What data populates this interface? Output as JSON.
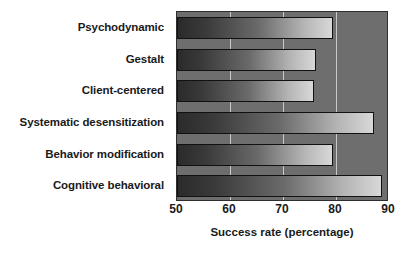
{
  "chart_data": {
    "type": "bar",
    "orientation": "horizontal",
    "title": "",
    "xlabel": "Success rate (percentage)",
    "ylabel": "",
    "categories": [
      "Psychodynamic",
      "Gestalt",
      "Client-centered",
      "Systematic desensitization",
      "Behavior modification",
      "Cognitive behavioral"
    ],
    "values": [
      79.5,
      76.3,
      75.8,
      87.2,
      79.5,
      88.6
    ],
    "xlim": [
      50,
      90
    ],
    "xticks": [
      50,
      60,
      70,
      80,
      90
    ],
    "xtick_labels": [
      "50",
      "60",
      "70",
      "80",
      "90"
    ],
    "grid": true,
    "grid_axis": "x",
    "legend": null,
    "plot_background": "#6e6e6e",
    "gridline_color": "#c9c9c9",
    "bar_gradient_from": "#2b2b2b",
    "bar_gradient_to": "#d8d8d8",
    "bar_outline": "#111111"
  }
}
